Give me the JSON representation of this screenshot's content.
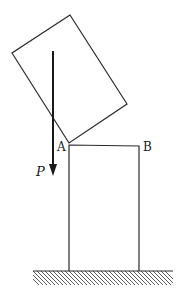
{
  "diagram": {
    "labels": {
      "point_a": "A",
      "point_b": "B",
      "force": "P"
    },
    "colors": {
      "stroke": "#2a2a2a",
      "background": "#ffffff"
    },
    "elements": [
      "tilted-block",
      "upright-block",
      "force-arrow-P",
      "hatched-ground"
    ]
  }
}
